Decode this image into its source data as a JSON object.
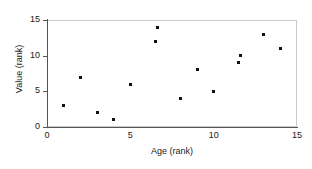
{
  "chart_data": {
    "type": "scatter",
    "title": "",
    "xlabel": "Age (rank)",
    "ylabel": "Value (rank)",
    "xlim": [
      0,
      15
    ],
    "ylim": [
      0,
      15
    ],
    "xticks": [
      0,
      5,
      10,
      15
    ],
    "yticks": [
      0,
      5,
      10,
      15
    ],
    "xtick_labels": [
      "0",
      "5",
      "10",
      "15"
    ],
    "ytick_labels": [
      "0",
      "5",
      "10",
      "15"
    ],
    "grid": false,
    "legend": null,
    "marker": "square",
    "marker_color": "#111111",
    "series": [
      {
        "name": "ranks",
        "x": [
          1,
          2,
          3,
          4,
          5,
          6.5,
          6.6,
          8,
          9,
          10,
          11.5,
          11.6,
          13,
          14
        ],
        "y": [
          3,
          7,
          2,
          1,
          6,
          12,
          14,
          4,
          8,
          5,
          9,
          10,
          13,
          11
        ]
      }
    ],
    "points": [
      {
        "x": 1,
        "y": 3
      },
      {
        "x": 2,
        "y": 7
      },
      {
        "x": 3,
        "y": 2
      },
      {
        "x": 4,
        "y": 1
      },
      {
        "x": 5,
        "y": 6
      },
      {
        "x": 6.5,
        "y": 12
      },
      {
        "x": 6.6,
        "y": 14
      },
      {
        "x": 8,
        "y": 4
      },
      {
        "x": 9,
        "y": 8
      },
      {
        "x": 10,
        "y": 5
      },
      {
        "x": 11.5,
        "y": 9
      },
      {
        "x": 11.6,
        "y": 10
      },
      {
        "x": 13,
        "y": 13
      },
      {
        "x": 14,
        "y": 11
      }
    ]
  }
}
